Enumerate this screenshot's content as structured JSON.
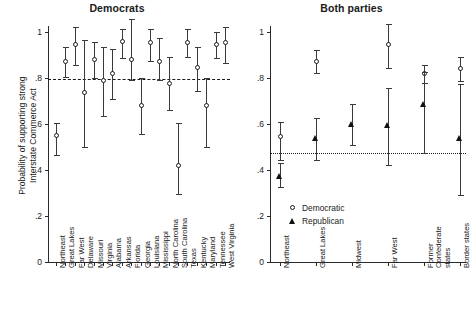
{
  "figure": {
    "ylabel": "Probability of supporting strong\nInterstate Commerce Act",
    "ytick_labels": [
      "0",
      ".2",
      ".4",
      ".6",
      ".8",
      "1"
    ]
  },
  "legend": {
    "democratic": "Democratic",
    "republican": "Republican"
  },
  "chart_data": [
    {
      "type": "scatter",
      "title": "Democrats",
      "xlabel": "",
      "ylabel": "Probability of supporting strong Interstate Commerce Act",
      "ylim": [
        0,
        1.05
      ],
      "yticks": [
        0,
        0.2,
        0.4,
        0.6,
        0.8,
        1
      ],
      "grid": false,
      "legend_position": "none",
      "reference_line": {
        "value": 0.795,
        "style": "dashed"
      },
      "marker": "open-circle",
      "categories": [
        "Northeast",
        "Great Lakes",
        "Far West",
        "Delaware",
        "Missouri",
        "Virginia",
        "Alabama",
        "Arkansas",
        "Florida",
        "Georgia",
        "Louisiana",
        "Mississippi",
        "North Carolina",
        "South Carolina",
        "Texas",
        "Kentucky",
        "Maryland",
        "Tennessee",
        "West Virginia"
      ],
      "values": [
        0.55,
        0.87,
        0.945,
        0.735,
        0.88,
        0.79,
        0.82,
        0.96,
        0.88,
        0.68,
        0.955,
        0.87,
        0.775,
        0.42,
        0.955,
        0.845,
        0.68,
        0.945,
        0.955
      ],
      "ci_low": [
        0.465,
        0.805,
        0.855,
        0.5,
        0.8,
        0.635,
        0.71,
        0.885,
        0.79,
        0.555,
        0.875,
        0.79,
        0.66,
        0.295,
        0.89,
        0.745,
        0.5,
        0.885,
        0.865
      ],
      "ci_high": [
        0.605,
        0.935,
        1.02,
        0.965,
        0.955,
        0.935,
        0.925,
        1.015,
        1.055,
        0.8,
        1.015,
        0.975,
        0.89,
        0.605,
        1.015,
        0.935,
        0.8,
        1.0,
        1.02
      ]
    },
    {
      "type": "scatter",
      "title": "Both parties",
      "xlabel": "",
      "ylabel": "",
      "ylim": [
        0,
        1.05
      ],
      "yticks": [
        0,
        0.2,
        0.4,
        0.6,
        0.8,
        1
      ],
      "grid": false,
      "legend_position": "bottom-left",
      "reference_line": {
        "value": 0.475,
        "style": "dotted"
      },
      "categories": [
        "Northeast",
        "Great Lakes",
        "Midwest",
        "Far West",
        "Former Confederate states",
        "Border states"
      ],
      "series": [
        {
          "name": "Democratic",
          "marker": "open-circle",
          "values": [
            0.545,
            0.87,
            null,
            0.945,
            0.82,
            0.84
          ],
          "ci_low": [
            0.445,
            0.82,
            null,
            0.845,
            0.78,
            0.785
          ],
          "ci_high": [
            0.61,
            0.92,
            null,
            1.035,
            0.855,
            0.89
          ]
        },
        {
          "name": "Republican",
          "marker": "filled-triangle",
          "values": [
            0.375,
            0.54,
            0.6,
            0.595,
            0.685,
            0.54
          ],
          "ci_low": [
            0.325,
            0.445,
            0.51,
            0.42,
            0.475,
            0.29
          ],
          "ci_high": [
            0.43,
            0.625,
            0.685,
            0.755,
            0.825,
            0.775
          ]
        }
      ]
    }
  ]
}
